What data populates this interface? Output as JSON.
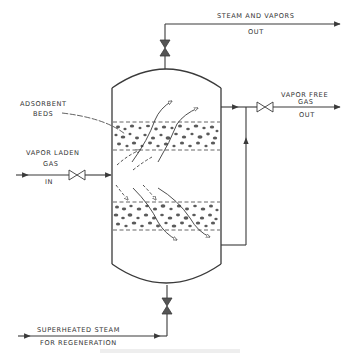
{
  "diagram": {
    "colors": {
      "line": "#3a3a3a",
      "particle": "#555555",
      "caption": "#e8e8e8"
    },
    "labels": {
      "steam_out_line1": "STEAM AND VAPORS",
      "steam_out_line2": "OUT",
      "vapor_free_line1": "VAPOR FREE",
      "vapor_free_line2": "GAS",
      "vapor_free_line3": "OUT",
      "adsorbent_line1": "ADSORBENT",
      "adsorbent_line2": "BEDS",
      "vapor_laden_line1": "VAPOR LADEN",
      "vapor_laden_line2": "GAS",
      "vapor_laden_line3": "IN",
      "steam_in_line1": "SUPERHEATED  STEAM",
      "steam_in_line2": "FOR  REGENERATION"
    },
    "components": [
      {
        "id": "vessel",
        "type": "adsorber-vessel"
      },
      {
        "id": "bed-upper",
        "type": "adsorbent-bed"
      },
      {
        "id": "bed-lower",
        "type": "adsorbent-bed"
      },
      {
        "id": "valve-top",
        "type": "gate-valve",
        "line": "steam-and-vapors-out"
      },
      {
        "id": "valve-inlet",
        "type": "gate-valve",
        "line": "vapor-laden-gas-in"
      },
      {
        "id": "valve-outlet",
        "type": "gate-valve",
        "line": "vapor-free-gas-out"
      },
      {
        "id": "valve-bottom",
        "type": "gate-valve",
        "line": "superheated-steam-in"
      }
    ],
    "caption": ""
  }
}
